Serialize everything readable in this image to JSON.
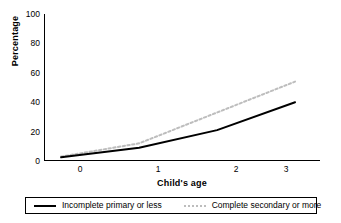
{
  "chart_data": {
    "type": "line",
    "title": "",
    "xlabel": "Child's age",
    "ylabel": "Percentage",
    "x": [
      0,
      1,
      2,
      3
    ],
    "xlim": [
      -0.22,
      3.32
    ],
    "ylim": [
      0,
      100
    ],
    "xticks": [
      "0",
      "1",
      "2",
      "3"
    ],
    "yticks": [
      "0",
      "20",
      "40",
      "60",
      "80",
      "100"
    ],
    "grid": false,
    "legend_position": "bottom",
    "series": [
      {
        "name": "Incomplete primary or less",
        "values": [
          2.5,
          9,
          21,
          40
        ],
        "style": "solid",
        "color": "#000000",
        "swatch": "rule-solid"
      },
      {
        "name": "Complete secondary or more",
        "values": [
          3,
          12,
          33,
          54
        ],
        "style": "dotted",
        "color": "#bdbdbd",
        "swatch": "rule-dashed"
      }
    ]
  },
  "axes": {
    "y_title": "Percentage",
    "x_title": "Child's age",
    "y_tick_labels": [
      "100",
      "80",
      "60",
      "40",
      "20",
      "0"
    ],
    "x_tick_labels": [
      "0",
      "1",
      "2",
      "3"
    ]
  },
  "legend": {
    "items": [
      {
        "label": "Incomplete primary or less"
      },
      {
        "label": "Complete secondary or more"
      }
    ]
  },
  "colors": {
    "axis": "#000000",
    "series_solid": "#000000",
    "series_dotted": "#bdbdbd",
    "background": "#ffffff"
  }
}
